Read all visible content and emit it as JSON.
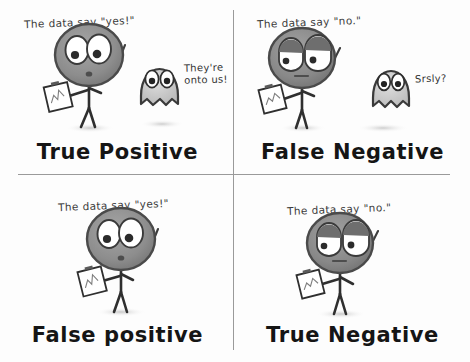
{
  "figure": {
    "background_color": "#fdfdfd",
    "ink_color": "#2a2a2a",
    "head_fill": "#8c8c8c",
    "divider_color": "#9a9a9a"
  },
  "panels": [
    {
      "id": "true-positive",
      "caption": "True Positive",
      "speech": "The data say \"yes!\"",
      "scientist": {
        "expression": "wide-eyed-alert",
        "holds": "clipboard-with-chart"
      },
      "ghost": {
        "present": true,
        "expression": "wide-eyes",
        "speech": "They're onto us!"
      }
    },
    {
      "id": "false-negative",
      "caption": "False Negative",
      "speech": "The data say \"no.\"",
      "scientist": {
        "expression": "droopy-sleepy",
        "holds": "clipboard-with-chart"
      },
      "ghost": {
        "present": true,
        "expression": "wide-eyes",
        "speech": "Srsly?"
      }
    },
    {
      "id": "false-positive",
      "caption": "False positive",
      "speech": "The data say \"yes!\"",
      "scientist": {
        "expression": "wide-eyed-alert",
        "holds": "clipboard-with-chart"
      },
      "ghost": {
        "present": false,
        "expression": "",
        "speech": ""
      }
    },
    {
      "id": "true-negative",
      "caption": "True Negative",
      "speech": "The data say \"no.\"",
      "scientist": {
        "expression": "droopy-sleepy",
        "holds": "clipboard-with-chart"
      },
      "ghost": {
        "present": false,
        "expression": "",
        "speech": ""
      }
    }
  ]
}
